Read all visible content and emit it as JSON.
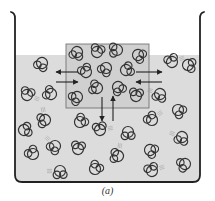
{
  "figure": {
    "caption": "(a)",
    "colors": {
      "water": "#dcdcdc",
      "beaker": "#222222",
      "molecule": "#333333",
      "box": "#666666",
      "arrow": "#222222",
      "motion": "#9a9a9a"
    },
    "beaker": {
      "left": 15,
      "right": 200,
      "top": 13,
      "bottom": 182,
      "water_level": 55
    },
    "highlight_box": {
      "x": 66,
      "y": 44,
      "w": 83,
      "h": 64
    },
    "arrows": [
      {
        "dir": "left",
        "x1": 78,
        "y1": 72,
        "x2": 56,
        "y2": 72
      },
      {
        "dir": "right",
        "x1": 56,
        "y1": 82,
        "x2": 78,
        "y2": 82
      },
      {
        "dir": "right",
        "x1": 136,
        "y1": 72,
        "x2": 162,
        "y2": 72
      },
      {
        "dir": "left",
        "x1": 162,
        "y1": 82,
        "x2": 136,
        "y2": 82
      },
      {
        "dir": "down",
        "x1": 102,
        "y1": 97,
        "x2": 102,
        "y2": 121
      },
      {
        "dir": "up",
        "x1": 113,
        "y1": 121,
        "x2": 113,
        "y2": 96
      }
    ],
    "molecules_inside": [
      [
        77,
        52,
        20
      ],
      [
        97,
        52,
        200
      ],
      [
        117,
        50,
        90
      ],
      [
        138,
        55,
        300
      ],
      [
        86,
        72,
        150
      ],
      [
        106,
        68,
        40
      ],
      [
        126,
        70,
        250
      ],
      [
        97,
        88,
        110
      ],
      [
        118,
        87,
        330
      ],
      [
        77,
        97,
        60
      ],
      [
        136,
        96,
        190
      ]
    ],
    "molecules_outside": [
      [
        42,
        63,
        30
      ],
      [
        172,
        62,
        160
      ],
      [
        188,
        65,
        280
      ],
      [
        27,
        95,
        200
      ],
      [
        51,
        94,
        120
      ],
      [
        160,
        94,
        20
      ],
      [
        178,
        110,
        310
      ],
      [
        45,
        120,
        80
      ],
      [
        80,
        122,
        230
      ],
      [
        100,
        130,
        170
      ],
      [
        128,
        132,
        0
      ],
      [
        152,
        120,
        140
      ],
      [
        24,
        130,
        260
      ],
      [
        55,
        146,
        45
      ],
      [
        78,
        149,
        190
      ],
      [
        118,
        156,
        100
      ],
      [
        150,
        150,
        300
      ],
      [
        182,
        137,
        20
      ],
      [
        33,
        154,
        140
      ],
      [
        60,
        171,
        0
      ],
      [
        95,
        169,
        220
      ],
      [
        152,
        171,
        160
      ],
      [
        185,
        164,
        70
      ]
    ]
  }
}
